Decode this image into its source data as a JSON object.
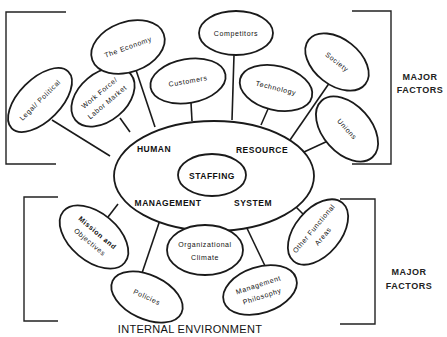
{
  "diagram": {
    "center": {
      "outer_labels": {
        "top_left": "HUMAN",
        "top_right": "RESOURCE",
        "bottom_left": "MANAGEMENT",
        "bottom_right": "SYSTEM"
      },
      "inner_label": "STAFFING"
    },
    "external_factors": [
      {
        "id": "legal",
        "lines": [
          "Legal/ Political"
        ]
      },
      {
        "id": "workforce",
        "lines": [
          "Work Force/",
          "Labor Market"
        ]
      },
      {
        "id": "economy",
        "lines": [
          "The Economy"
        ]
      },
      {
        "id": "customers",
        "lines": [
          "Customers"
        ]
      },
      {
        "id": "competitors",
        "lines": [
          "Competitors"
        ]
      },
      {
        "id": "technology",
        "lines": [
          "Technology"
        ]
      },
      {
        "id": "society",
        "lines": [
          "Society"
        ]
      },
      {
        "id": "unions",
        "lines": [
          "Unions"
        ]
      }
    ],
    "internal_factors": [
      {
        "id": "mission",
        "lines": [
          "Mission and",
          "Objectives"
        ]
      },
      {
        "id": "policies",
        "lines": [
          "Policies"
        ]
      },
      {
        "id": "climate",
        "lines": [
          "Organizational",
          "Climate"
        ]
      },
      {
        "id": "philosophy",
        "lines": [
          "Management",
          "Philosophy"
        ]
      },
      {
        "id": "other",
        "lines": [
          "Other Functional",
          "Areas"
        ]
      }
    ],
    "bracket_labels": {
      "upper": [
        "MAJOR",
        "FACTORS"
      ],
      "lower": [
        "MAJOR",
        "FACTORS"
      ]
    },
    "footer": "INTERNAL ENVIRONMENT"
  }
}
